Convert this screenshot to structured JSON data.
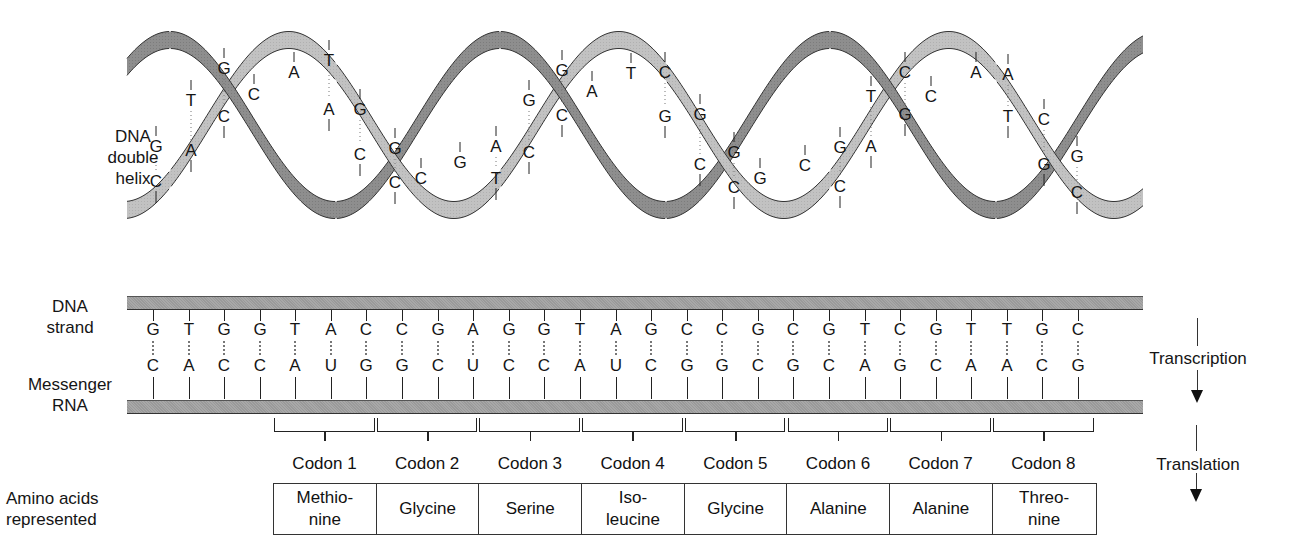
{
  "helix": {
    "label": "DNA\ndouble\nhelix",
    "label_lines": [
      "DNA",
      "double",
      "helix"
    ],
    "base_pairs": [
      {
        "x": 156,
        "top": "G",
        "bottom": "C",
        "ty": 152,
        "by": 187
      },
      {
        "x": 191,
        "top": "T",
        "bottom": "A",
        "ty": 106,
        "by": 156
      },
      {
        "x": 224,
        "top": "G",
        "bottom": "C",
        "ty": 74,
        "by": 122
      },
      {
        "x": 254,
        "top": "C",
        "bottom": "",
        "ty": 100,
        "by": 0
      },
      {
        "x": 294,
        "top": "A",
        "bottom": "",
        "ty": 78,
        "by": 0
      },
      {
        "x": 329,
        "top": "T",
        "bottom": "A",
        "ty": 66,
        "by": 115
      },
      {
        "x": 360,
        "top": "G",
        "bottom": "C",
        "ty": 115,
        "by": 160
      },
      {
        "x": 395,
        "top": "G",
        "bottom": "C",
        "ty": 154,
        "by": 188
      },
      {
        "x": 421,
        "top": "C",
        "bottom": "",
        "ty": 184,
        "by": 0
      },
      {
        "x": 460,
        "top": "G",
        "bottom": "",
        "ty": 168,
        "by": 0
      },
      {
        "x": 496,
        "top": "A",
        "bottom": "T",
        "ty": 152,
        "by": 184
      },
      {
        "x": 529,
        "top": "G",
        "bottom": "C",
        "ty": 106,
        "by": 158
      },
      {
        "x": 562,
        "top": "G",
        "bottom": "C",
        "ty": 76,
        "by": 121
      },
      {
        "x": 592,
        "top": "A",
        "bottom": "",
        "ty": 97,
        "by": 0
      },
      {
        "x": 631,
        "top": "T",
        "bottom": "",
        "ty": 79,
        "by": 0
      },
      {
        "x": 665,
        "top": "C",
        "bottom": "G",
        "ty": 78,
        "by": 122
      },
      {
        "x": 700,
        "top": "G",
        "bottom": "C",
        "ty": 120,
        "by": 170
      },
      {
        "x": 734,
        "top": "G",
        "bottom": "C",
        "ty": 158,
        "by": 193
      },
      {
        "x": 760,
        "top": "G",
        "bottom": "",
        "ty": 184,
        "by": 0
      },
      {
        "x": 805,
        "top": "C",
        "bottom": "",
        "ty": 171,
        "by": 0
      },
      {
        "x": 840,
        "top": "G",
        "bottom": "C",
        "ty": 153,
        "by": 192
      },
      {
        "x": 871,
        "top": "T",
        "bottom": "A",
        "ty": 102,
        "by": 152
      },
      {
        "x": 905,
        "top": "C",
        "bottom": "G",
        "ty": 78,
        "by": 120
      },
      {
        "x": 931,
        "top": "C",
        "bottom": "",
        "ty": 102,
        "by": 0
      },
      {
        "x": 976,
        "top": "A",
        "bottom": "",
        "ty": 78,
        "by": 0
      },
      {
        "x": 1008,
        "top": "A",
        "bottom": "T",
        "ty": 80,
        "by": 122
      },
      {
        "x": 1044,
        "top": "C",
        "bottom": "G",
        "ty": 125,
        "by": 170
      },
      {
        "x": 1077,
        "top": "G",
        "bottom": "C",
        "ty": 162,
        "by": 198
      }
    ]
  },
  "strands": {
    "dna_label": "DNA\nstrand",
    "dna_label_lines": [
      "DNA",
      "strand"
    ],
    "mrna_label_lines": [
      "Messenger",
      "RNA"
    ],
    "dna_bases": [
      "G",
      "T",
      "G",
      "G",
      "T",
      "A",
      "C",
      "C",
      "G",
      "A",
      "G",
      "G",
      "T",
      "A",
      "G",
      "C",
      "C",
      "G",
      "C",
      "G",
      "T",
      "C",
      "G",
      "T",
      "T",
      "G",
      "C"
    ],
    "mrna_bases": [
      "C",
      "A",
      "C",
      "C",
      "A",
      "U",
      "G",
      "G",
      "C",
      "U",
      "C",
      "C",
      "A",
      "U",
      "C",
      "G",
      "G",
      "C",
      "G",
      "C",
      "A",
      "G",
      "C",
      "A",
      "A",
      "C",
      "G"
    ]
  },
  "process": {
    "transcription": "Transcription",
    "translation": "Translation"
  },
  "codons": [
    {
      "label": "Codon 1",
      "amino_acid": "Methio-\nnine"
    },
    {
      "label": "Codon 2",
      "amino_acid": "Glycine"
    },
    {
      "label": "Codon 3",
      "amino_acid": "Serine"
    },
    {
      "label": "Codon 4",
      "amino_acid": "Iso-\nleucine"
    },
    {
      "label": "Codon 5",
      "amino_acid": "Glycine"
    },
    {
      "label": "Codon 6",
      "amino_acid": "Alanine"
    },
    {
      "label": "Codon 7",
      "amino_acid": "Alanine"
    },
    {
      "label": "Codon 8",
      "amino_acid": "Threo-\nnine"
    }
  ],
  "amino_label_lines": [
    "Amino acids",
    "represented"
  ],
  "colors": {
    "ribbon_dark": "#8c8c8c",
    "ribbon_light": "#bdbdbd",
    "strand_bar": "#a0a0a0",
    "text": "#151515"
  }
}
